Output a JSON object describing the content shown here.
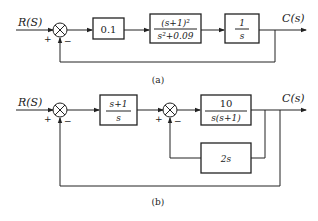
{
  "diagram_a": {
    "input_label": "R(S)",
    "output_label": "C(s)",
    "summer_signs": {
      "plus": "+",
      "minus": "−"
    },
    "blocks": [
      {
        "id": "gain",
        "text": "0.1"
      },
      {
        "id": "plant",
        "numerator": "(s+1)²",
        "denominator": "s²+0.09"
      },
      {
        "id": "integrator",
        "numerator": "1",
        "denominator": "s"
      }
    ],
    "caption": "(a)"
  },
  "diagram_b": {
    "input_label": "R(S)",
    "output_label": "C(s)",
    "summer1_signs": {
      "plus": "+",
      "minus": "−"
    },
    "summer2_signs": {
      "plus": "+",
      "minus": "−"
    },
    "blocks": [
      {
        "id": "controller",
        "numerator": "s+1",
        "denominator": "s"
      },
      {
        "id": "plant",
        "numerator": "10",
        "denominator": "s(s+1)"
      },
      {
        "id": "feedback",
        "text": "2s"
      }
    ],
    "caption": "(b)"
  }
}
